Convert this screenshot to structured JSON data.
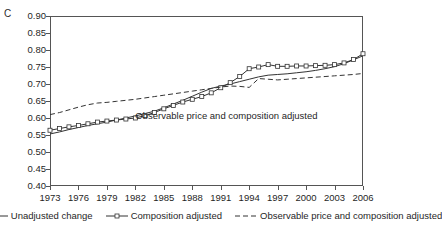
{
  "panel": {
    "label": "C"
  },
  "chart_data": {
    "type": "line",
    "title": "",
    "xlabel": "",
    "ylabel": "",
    "xlim": [
      1973,
      2006
    ],
    "ylim": [
      0.4,
      0.9
    ],
    "grid": false,
    "legend_position": "bottom",
    "y_ticks": [
      "0.90",
      "0.85",
      "0.80",
      "0.75",
      "0.70",
      "0.65",
      "0.60",
      "0.55",
      "0.50",
      "0.45",
      "0.40"
    ],
    "y_tick_values": [
      0.9,
      0.85,
      0.8,
      0.75,
      0.7,
      0.65,
      0.6,
      0.55,
      0.5,
      0.45,
      0.4
    ],
    "x_ticks": [
      "1973",
      "1976",
      "1979",
      "1982",
      "1985",
      "1988",
      "1991",
      "1994",
      "1997",
      "2000",
      "2003",
      "2006"
    ],
    "x_tick_values": [
      1973,
      1976,
      1979,
      1982,
      1985,
      1988,
      1991,
      1994,
      1997,
      2000,
      2003,
      2006
    ],
    "x": [
      1973,
      1974,
      1975,
      1976,
      1977,
      1978,
      1979,
      1980,
      1981,
      1982,
      1983,
      1984,
      1985,
      1986,
      1987,
      1988,
      1989,
      1990,
      1991,
      1992,
      1993,
      1994,
      1995,
      1996,
      1997,
      1998,
      1999,
      2000,
      2001,
      2002,
      2003,
      2004,
      2005,
      2006
    ],
    "series": [
      {
        "name": "Unadjusted change",
        "style": "solid",
        "marker": "none",
        "color": "#333333",
        "values": [
          0.553,
          0.559,
          0.566,
          0.572,
          0.578,
          0.583,
          0.588,
          0.594,
          0.6,
          0.606,
          0.613,
          0.62,
          0.63,
          0.641,
          0.652,
          0.664,
          0.676,
          0.687,
          0.694,
          0.7,
          0.707,
          0.714,
          0.721,
          0.726,
          0.728,
          0.73,
          0.733,
          0.736,
          0.74,
          0.745,
          0.751,
          0.76,
          0.771,
          0.783
        ]
      },
      {
        "name": "Composition adjusted",
        "style": "solid",
        "marker": "open-square",
        "color": "#333333",
        "values": [
          0.564,
          0.569,
          0.574,
          0.578,
          0.583,
          0.588,
          0.591,
          0.594,
          0.597,
          0.6,
          0.607,
          0.616,
          0.627,
          0.637,
          0.647,
          0.655,
          0.663,
          0.674,
          0.689,
          0.704,
          0.722,
          0.745,
          0.75,
          0.757,
          0.752,
          0.752,
          0.753,
          0.753,
          0.754,
          0.755,
          0.757,
          0.762,
          0.772,
          0.789
        ]
      },
      {
        "name": "Observable price and composition adjusted",
        "style": "dashed",
        "marker": "none",
        "color": "#333333",
        "values": [
          0.61,
          0.616,
          0.624,
          0.632,
          0.639,
          0.644,
          0.646,
          0.649,
          0.652,
          0.655,
          0.659,
          0.663,
          0.667,
          0.671,
          0.675,
          0.679,
          0.683,
          0.687,
          0.691,
          0.694,
          0.693,
          0.69,
          0.716,
          0.714,
          0.712,
          0.714,
          0.716,
          0.718,
          0.72,
          0.722,
          0.724,
          0.726,
          0.728,
          0.731
        ]
      }
    ],
    "annotations": [
      {
        "text": "Observable price and composition adjusted",
        "x": 1982.0,
        "y": 0.605
      }
    ]
  },
  "legend": {
    "items": [
      {
        "label": "Unadjusted change",
        "glyph": "solid-line-icon"
      },
      {
        "label": "Composition adjusted",
        "glyph": "solid-line-square-marker-icon"
      },
      {
        "label": "Observable price and composition adjusted",
        "glyph": "dashed-line-icon"
      }
    ]
  }
}
